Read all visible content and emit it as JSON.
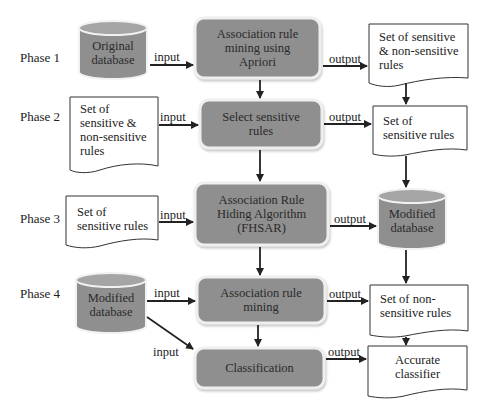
{
  "colors": {
    "process_fill": "#8f8f8f",
    "process_border": "#ececec",
    "database_fill": "#8f8f8f",
    "database_top": "#a2a2a2",
    "document_fill": "#ffffff",
    "document_stroke": "#333333",
    "arrow": "#222222"
  },
  "phases": [
    {
      "label": "Phase 1"
    },
    {
      "label": "Phase 2"
    },
    {
      "label": "Phase 3"
    },
    {
      "label": "Phase 4"
    }
  ],
  "nodes": {
    "original_db": {
      "type": "database",
      "lines": [
        "Original",
        "database"
      ]
    },
    "apriori": {
      "type": "process",
      "lines": [
        "Association rule",
        "mining using",
        "Apriori"
      ]
    },
    "out_all_rules": {
      "type": "document",
      "lines": [
        "Set of sensitive",
        "& non-sensitive",
        "rules"
      ]
    },
    "in_all_rules": {
      "type": "document",
      "lines": [
        "Set of",
        "sensitive &",
        "non-sensitive",
        "rules"
      ]
    },
    "select_sensitive": {
      "type": "process",
      "lines": [
        "Select sensitive",
        "rules"
      ]
    },
    "out_sensitive": {
      "type": "document",
      "lines": [
        "Set of",
        "sensitive rules"
      ]
    },
    "in_sensitive": {
      "type": "document",
      "lines": [
        "Set of",
        "sensitive rules"
      ]
    },
    "fhsar": {
      "type": "process",
      "lines": [
        "Association Rule",
        "Hiding Algorithm",
        "(FHSAR)"
      ]
    },
    "modified_db_out": {
      "type": "database",
      "lines": [
        "Modified",
        "database"
      ]
    },
    "modified_db_in": {
      "type": "database",
      "lines": [
        "Modified",
        "database"
      ]
    },
    "arm": {
      "type": "process",
      "lines": [
        "Association rule",
        "mining"
      ]
    },
    "out_nonsensitive": {
      "type": "document",
      "lines": [
        "Set of non-",
        "sensitive rules"
      ]
    },
    "classification": {
      "type": "process",
      "lines": [
        "Classification"
      ]
    },
    "accurate_classifier": {
      "type": "document",
      "lines": [
        "Accurate",
        "classifier"
      ]
    }
  },
  "edges": [
    {
      "from": "original_db",
      "to": "apriori",
      "label": "input"
    },
    {
      "from": "apriori",
      "to": "out_all_rules",
      "label": "output"
    },
    {
      "from": "in_all_rules",
      "to": "select_sensitive",
      "label": "input"
    },
    {
      "from": "select_sensitive",
      "to": "out_sensitive",
      "label": "output"
    },
    {
      "from": "in_sensitive",
      "to": "fhsar",
      "label": "input"
    },
    {
      "from": "fhsar",
      "to": "modified_db_out",
      "label": "output"
    },
    {
      "from": "modified_db_in",
      "to": "arm",
      "label": "input"
    },
    {
      "from": "arm",
      "to": "out_nonsensitive",
      "label": "output"
    },
    {
      "from": "modified_db_in",
      "to": "classification",
      "label": "input"
    },
    {
      "from": "classification",
      "to": "accurate_classifier",
      "label": "output"
    },
    {
      "from": "apriori",
      "to": "select_sensitive",
      "label": ""
    },
    {
      "from": "select_sensitive",
      "to": "fhsar",
      "label": ""
    },
    {
      "from": "fhsar",
      "to": "arm",
      "label": ""
    },
    {
      "from": "arm",
      "to": "classification",
      "label": ""
    },
    {
      "from": "out_all_rules",
      "to": "out_sensitive",
      "label": ""
    },
    {
      "from": "out_sensitive",
      "to": "modified_db_out",
      "label": ""
    },
    {
      "from": "modified_db_out",
      "to": "out_nonsensitive",
      "label": ""
    },
    {
      "from": "out_nonsensitive",
      "to": "accurate_classifier",
      "label": ""
    }
  ]
}
